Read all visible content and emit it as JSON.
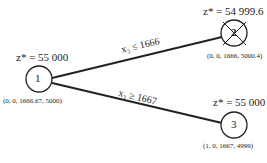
{
  "diagram": {
    "type": "branch-and-bound-tree",
    "nodes": [
      {
        "id": "1",
        "label": "1",
        "z": "z* = 55 000",
        "solution": "(0, 0, 1666.67, 5000)",
        "fathomed": false
      },
      {
        "id": "2",
        "label": "2",
        "z": "z* = 54 999.6",
        "solution": "(0, 0, 1666, 5000.4)",
        "fathomed": true
      },
      {
        "id": "3",
        "label": "3",
        "z": "z* = 55 000",
        "solution": "(1, 0, 1667, 4999)",
        "fathomed": false
      }
    ],
    "edges": [
      {
        "from": "1",
        "to": "2",
        "label": "x₃ ≤ 1666"
      },
      {
        "from": "1",
        "to": "3",
        "label": "x₃ ≥ 1667"
      }
    ],
    "caption": ""
  }
}
